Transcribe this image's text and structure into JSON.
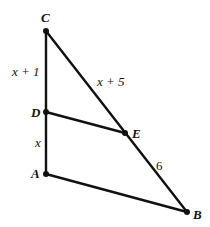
{
  "diagram": {
    "type": "geometry-triangle",
    "points": {
      "C": {
        "label": "C",
        "x": 46,
        "y": 31
      },
      "D": {
        "label": "D",
        "x": 46,
        "y": 112
      },
      "A": {
        "label": "A",
        "x": 46,
        "y": 174
      },
      "E": {
        "label": "E",
        "x": 125,
        "y": 133
      },
      "B": {
        "label": "B",
        "x": 187,
        "y": 212
      }
    },
    "segment_labels": {
      "CD": "x + 1",
      "DA": "x",
      "CE": "x + 5",
      "EB": "6"
    },
    "segments": [
      "CA",
      "CB",
      "AB",
      "DE"
    ],
    "colors": {
      "stroke": "#111111",
      "background": "#ffffff"
    }
  }
}
